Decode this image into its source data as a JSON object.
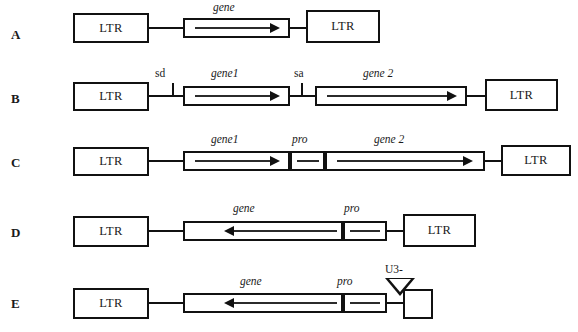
{
  "figure": {
    "type": "retroviral-vector-construct-diagram",
    "width": 578,
    "height": 332,
    "background": "#ffffff",
    "line_color": "#111111"
  },
  "rows": [
    {
      "id": "A",
      "label": "A",
      "left_ltr": "LTR",
      "right_ltr": "LTR",
      "labels": [
        "gene"
      ],
      "arrows": [
        {
          "name": "gene",
          "direction": "right"
        }
      ],
      "marks": []
    },
    {
      "id": "B",
      "label": "B",
      "left_ltr": "LTR",
      "right_ltr": "LTR",
      "labels": [
        "sd",
        "gene1",
        "sa",
        "gene 2"
      ],
      "arrows": [
        {
          "name": "gene1",
          "direction": "right"
        },
        {
          "name": "gene 2",
          "direction": "right"
        }
      ],
      "marks": [
        "sd",
        "sa"
      ]
    },
    {
      "id": "C",
      "label": "C",
      "left_ltr": "LTR",
      "right_ltr": "LTR",
      "labels": [
        "gene1",
        "pro",
        "gene 2"
      ],
      "arrows": [
        {
          "name": "gene1",
          "direction": "right"
        },
        {
          "name": "gene 2",
          "direction": "right"
        }
      ],
      "marks": []
    },
    {
      "id": "D",
      "label": "D",
      "left_ltr": "LTR",
      "right_ltr": "LTR",
      "labels": [
        "gene",
        "pro"
      ],
      "arrows": [
        {
          "name": "gene",
          "direction": "left"
        }
      ],
      "marks": []
    },
    {
      "id": "E",
      "label": "E",
      "left_ltr": "LTR",
      "right_ltr": "",
      "labels": [
        "gene",
        "pro",
        "U3-"
      ],
      "arrows": [
        {
          "name": "gene",
          "direction": "left"
        }
      ],
      "marks": [
        "U3-"
      ]
    }
  ],
  "text": {
    "ltr": "LTR",
    "gene": "gene",
    "gene1": "gene1",
    "gene2": "gene 2",
    "pro": "pro",
    "sd": "sd",
    "sa": "sa",
    "u3_minus": "U3-",
    "row_a": "A",
    "row_b": "B",
    "row_c": "C",
    "row_d": "D",
    "row_e": "E"
  }
}
